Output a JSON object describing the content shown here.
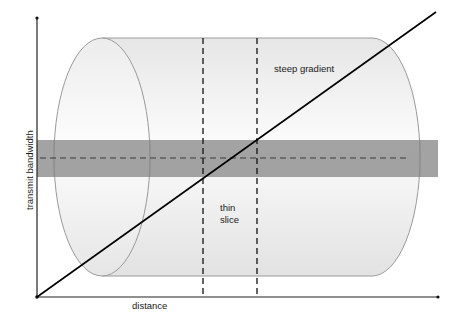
{
  "diagram": {
    "axes": {
      "x_label": "distance",
      "y_label": "transmit bandwidth",
      "origin": [
        37,
        297
      ],
      "x_end": [
        438,
        297
      ],
      "y_end": [
        37,
        18
      ],
      "color": "#111111"
    },
    "cylinder": {
      "top": 38,
      "bottom": 276,
      "left_ellipse": {
        "cx": 102,
        "cy": 157,
        "rx": 48,
        "ry": 119
      },
      "right_cx": 372,
      "right_rx": 48,
      "fill_top": "#e9e9e9",
      "fill_mid": "#fbfbfb",
      "fill_bottom": "#e4e4e4",
      "stroke": "#9a9a9a"
    },
    "band": {
      "x": 37,
      "y": 140,
      "width": 401,
      "height": 37,
      "color": "#9d9d9d",
      "dash_line": {
        "y": 158,
        "x1": 40,
        "x2": 406
      }
    },
    "slice_lines": [
      {
        "x": 203,
        "y1": 38,
        "y2": 297
      },
      {
        "x": 257,
        "y1": 38,
        "y2": 297
      }
    ],
    "diagonal": {
      "x1": 37,
      "y1": 297,
      "x2": 436,
      "y2": 12,
      "color": "#000000"
    },
    "annotations": {
      "steep_gradient": "steep gradient",
      "thin": "thin",
      "slice": "slice"
    }
  }
}
